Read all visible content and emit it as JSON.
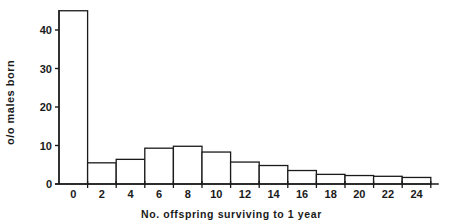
{
  "chart_data": {
    "type": "bar",
    "title": "",
    "xlabel": "No. offspring surviving to 1 year",
    "ylabel": "o/o males born",
    "categories": [
      "0",
      "2",
      "4",
      "6",
      "8",
      "10",
      "12",
      "14",
      "16",
      "18",
      "20",
      "22",
      "24"
    ],
    "values": [
      45,
      5.5,
      6.4,
      9.3,
      9.8,
      8.3,
      5.7,
      4.8,
      3.5,
      2.5,
      2.2,
      2.0,
      1.7
    ],
    "y_ticks": [
      0,
      10,
      20,
      30,
      40
    ],
    "ylim": [
      0,
      46
    ],
    "grid": false,
    "legend": null,
    "bar_fill": "#ffffff",
    "bar_stroke": "#1a1a1a"
  }
}
